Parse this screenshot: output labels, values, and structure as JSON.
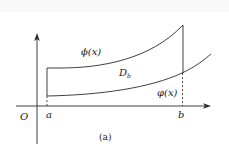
{
  "figure": {
    "caption": "(a)",
    "labels": {
      "origin": "O",
      "a": "a",
      "b": "b",
      "upper_curve": "ϕ(x)",
      "lower_curve": "φ(x)",
      "region": "D",
      "region_subscript": "b"
    },
    "elements": {
      "x_axis": "horizontal axis with arrow",
      "y_axis": "vertical axis with arrow",
      "region_boundary_left": "solid vertical line at x=a",
      "region_boundary_right": "solid vertical line at x=b (above lower curve)",
      "projection_b": "dashed vertical line from lower curve to x-axis at x=b",
      "projection_a": "short dashed line from lower curve to x-axis at x=a"
    },
    "colors": {
      "stroke": "#2a2a2a",
      "background": "#ffffff"
    }
  }
}
